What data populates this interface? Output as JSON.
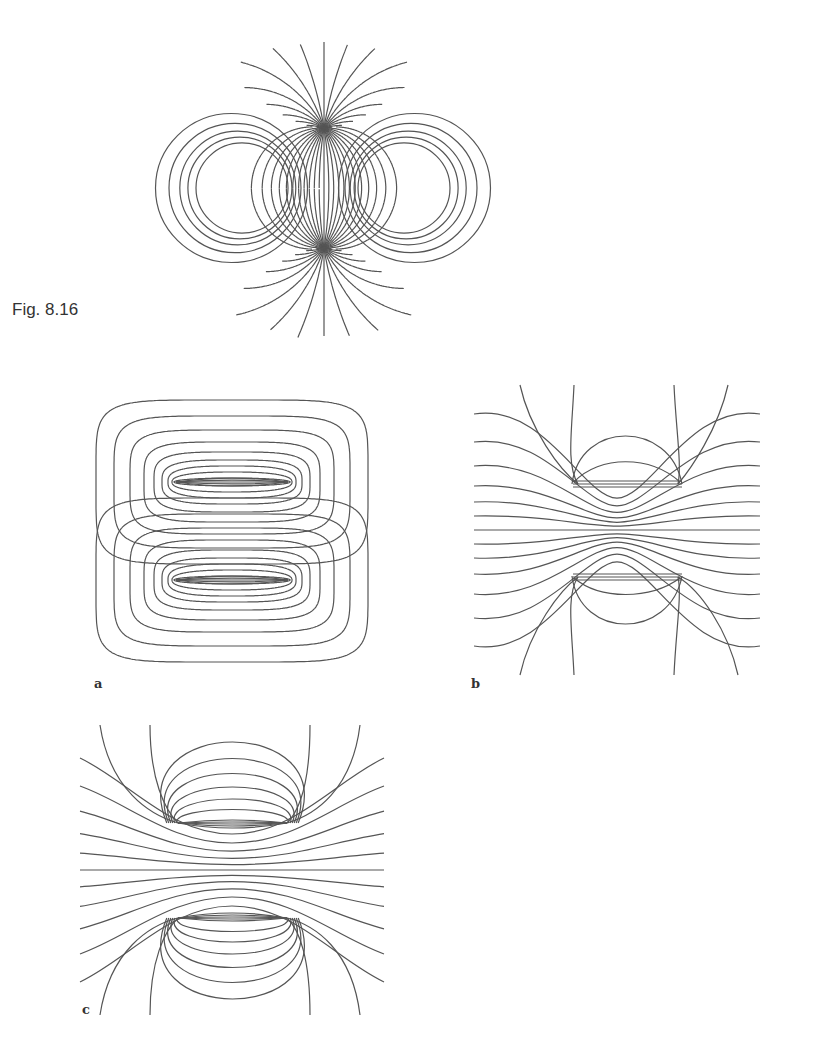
{
  "figure": {
    "caption": "Fig. 8.16",
    "line_color": "#555555",
    "top_figure": {
      "description": "field lines of two equal current loops / ring, lines passing between two circular regions",
      "center": [
        324,
        188
      ],
      "hole_centers": [
        [
          242,
          188
        ],
        [
          404,
          188
        ]
      ],
      "hole_radius": 46
    },
    "panels": [
      {
        "id": "a",
        "label": "a",
        "description": "closed field lines around two parallel plates (opposite orientation)"
      },
      {
        "id": "b",
        "label": "b",
        "description": "field lines passing between two parallel plates, with small loops above and below"
      },
      {
        "id": "c",
        "label": "c",
        "description": "field lines around two parallel plates, dipole-like pattern"
      }
    ]
  }
}
